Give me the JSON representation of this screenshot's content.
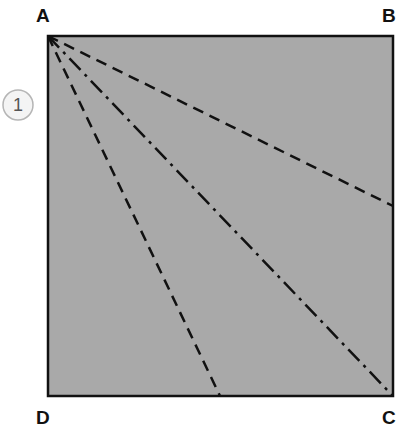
{
  "diagram": {
    "step_number": "1",
    "corners": {
      "A": {
        "label": "A",
        "x": 48,
        "y": 36
      },
      "B": {
        "label": "B",
        "x": 393,
        "y": 36
      },
      "C": {
        "label": "C",
        "x": 393,
        "y": 396
      },
      "D": {
        "label": "D",
        "x": 48,
        "y": 396
      }
    },
    "fill_color": "#a9a9a9",
    "stroke_color": "#111111",
    "fold_lines": [
      {
        "style": "dashed",
        "from": "A",
        "to": {
          "x": 393,
          "y": 206
        }
      },
      {
        "style": "dash-dot",
        "from": "A",
        "to": {
          "x": 393,
          "y": 396
        }
      },
      {
        "style": "dashed",
        "from": "A",
        "to": {
          "x": 220,
          "y": 396
        }
      }
    ]
  }
}
